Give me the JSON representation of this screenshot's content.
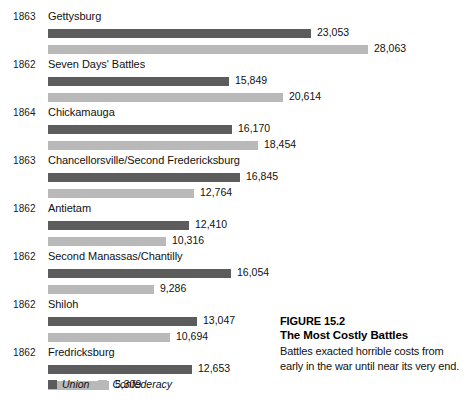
{
  "chart_data": {
    "type": "bar",
    "orientation": "horizontal",
    "title": "The Most Costly Battles",
    "figure_number": "FIGURE 15.2",
    "xlabel": "",
    "ylabel": "",
    "grid": false,
    "legend_position": "bottom-left",
    "value_axis_max": 28063,
    "categories": [
      "Gettysburg",
      "Seven Days' Battles",
      "Chickamauga",
      "Chancellorsville/Second Fredericksburg",
      "Antietam",
      "Second Manassas/Chantilly",
      "Shiloh",
      "Fredricksburg"
    ],
    "years": [
      "1863",
      "1862",
      "1864",
      "1863",
      "1862",
      "1862",
      "1862",
      "1862"
    ],
    "series": [
      {
        "name": "Union",
        "color": "#5c5c5c",
        "values": [
          23053,
          15849,
          16170,
          16845,
          12410,
          16054,
          13047,
          12653
        ],
        "labels": [
          "23,053",
          "15,849",
          "16,170",
          "16,845",
          "12,410",
          "16,054",
          "13,047",
          "12,653"
        ]
      },
      {
        "name": "Confederacy",
        "color": "#b9b9b9",
        "values": [
          28063,
          20614,
          18454,
          12764,
          10316,
          9286,
          10694,
          5309
        ],
        "labels": [
          "28,063",
          "20,614",
          "18,454",
          "12,764",
          "10,316",
          "9,286",
          "10,694",
          "5,309"
        ]
      }
    ]
  },
  "rows": [
    {
      "year": "1863",
      "name": "Gettysburg",
      "union": {
        "value": 23053,
        "label": "23,053"
      },
      "confed": {
        "value": 28063,
        "label": "28,063"
      }
    },
    {
      "year": "1862",
      "name": "Seven Days' Battles",
      "union": {
        "value": 15849,
        "label": "15,849"
      },
      "confed": {
        "value": 20614,
        "label": "20,614"
      }
    },
    {
      "year": "1864",
      "name": "Chickamauga",
      "union": {
        "value": 16170,
        "label": "16,170"
      },
      "confed": {
        "value": 18454,
        "label": "18,454"
      }
    },
    {
      "year": "1863",
      "name": "Chancellorsville/Second Fredericksburg",
      "union": {
        "value": 16845,
        "label": "16,845"
      },
      "confed": {
        "value": 12764,
        "label": "12,764"
      }
    },
    {
      "year": "1862",
      "name": "Antietam",
      "union": {
        "value": 12410,
        "label": "12,410"
      },
      "confed": {
        "value": 10316,
        "label": "10,316"
      }
    },
    {
      "year": "1862",
      "name": "Second Manassas/Chantilly",
      "union": {
        "value": 16054,
        "label": "16,054"
      },
      "confed": {
        "value": 9286,
        "label": "9,286"
      }
    },
    {
      "year": "1862",
      "name": "Shiloh",
      "union": {
        "value": 13047,
        "label": "13,047"
      },
      "confed": {
        "value": 10694,
        "label": "10,694"
      }
    },
    {
      "year": "1862",
      "name": "Fredricksburg",
      "union": {
        "value": 12653,
        "label": "12,653"
      },
      "confed": {
        "value": 5309,
        "label": "5,309"
      }
    }
  ],
  "legend": {
    "union_label": "Union",
    "confederacy_label": "Confederacy",
    "union_color": "#5c5c5c",
    "confederacy_color": "#b9b9b9"
  },
  "caption": {
    "figure_number": "FIGURE 15.2",
    "title": "The Most Costly Battles",
    "body": "Battles exacted horrible costs from early in the war until near its very end."
  }
}
